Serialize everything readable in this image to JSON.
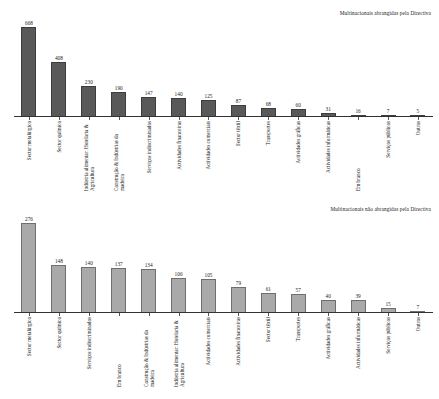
{
  "chart_data": [
    {
      "type": "bar",
      "title": "Multinacionais abrangidas pela Directiva",
      "xlabel": "",
      "ylabel": "",
      "ylim": [
        0,
        700
      ],
      "grid": false,
      "legend": "none",
      "bar_color": "#595959",
      "categories": [
        "Sector metalúrgico",
        "Sector químico",
        "Indústria alimentar: Hotelaria & Agricultura",
        "Construção & Indústrias da madeira",
        "Serviços indiscriminados",
        "Actividades financeiras",
        "Actividades comerciais",
        "Sector têxtil",
        "Transportes",
        "Actividades gráficas",
        "Actividades informáticas",
        "Em branco",
        "Serviços públicos",
        "Outros"
      ],
      "values": [
        668,
        408,
        230,
        190,
        147,
        140,
        125,
        87,
        68,
        60,
        31,
        16,
        7,
        5
      ]
    },
    {
      "type": "bar",
      "title": "Multinacionais não abrangidas pela Directiva",
      "xlabel": "",
      "ylabel": "",
      "ylim": [
        0,
        290
      ],
      "grid": false,
      "legend": "none",
      "bar_color": "#a9a9a9",
      "categories": [
        "Sector metalúrgico",
        "Sector químico",
        "Serviços indiscriminados",
        "Em branco",
        "Construção & Indústrias da madeira",
        "Indústria alimentar: Hotelaria & Agricultura",
        "Actividades comerciais",
        "Actividades financeiras",
        "Sector têxtil",
        "Transportes",
        "Actividades gráficas",
        "Actividades informáticas",
        "Serviços públicos",
        "Outros"
      ],
      "values": [
        276,
        148,
        140,
        137,
        134,
        106,
        105,
        79,
        61,
        57,
        40,
        39,
        15,
        7
      ]
    }
  ]
}
